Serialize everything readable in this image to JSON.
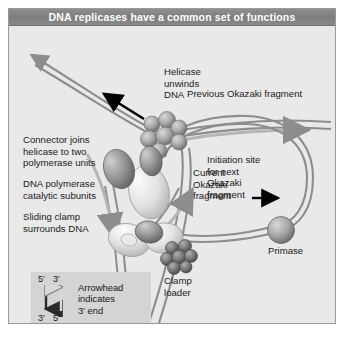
{
  "figure": {
    "title": "DNA replicases have a common set of functions",
    "background_color": "#e9e9e9",
    "title_bar_color": "#828282",
    "border_color": "#9a9a9a"
  },
  "labels": {
    "helicase": "Helicase\nunwinds\nDNA",
    "connector": "Connector joins\nhelicase to two\npolymerase units",
    "polymerase": "DNA polymerase\ncatalytic subunits",
    "sliding_clamp": "Sliding clamp\nsurrounds DNA",
    "previous_okazaki": "Previous Okazaki fragment",
    "current_okazaki": "Current\nOkazaki\nfragment",
    "initiation_site": "Initiation site\nfor next\nOkazaki\nfragment",
    "primase": "Primase",
    "clamp_loader": "Clamp\nloader"
  },
  "legend": {
    "top_left_tick": "5′",
    "top_right_tick": "3′",
    "bottom_left_tick": "3′",
    "bottom_right_tick": "5′",
    "text": "Arrowhead\nindicates\n3′ end",
    "background_color": "#d4d4d4"
  },
  "colors": {
    "dna_strand": "#8d8d8d",
    "helicase_sphere": "#a8a8a8",
    "polymerase_ellipse": "#8f8f8f",
    "clamp_ellipse": "#dedede",
    "clamp_loader_sphere": "#6d6d6d",
    "primase_sphere": "#9d9d9d",
    "pointer_arrow": "#000000"
  }
}
